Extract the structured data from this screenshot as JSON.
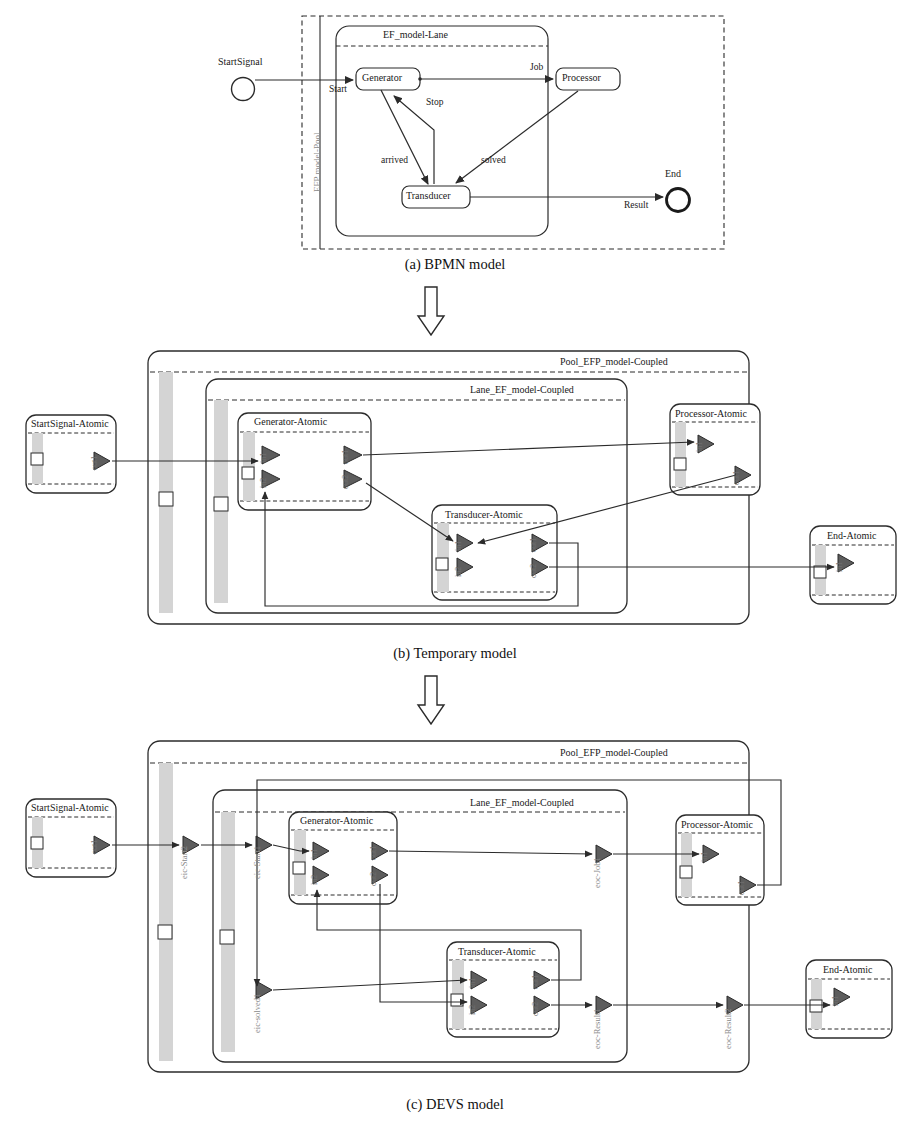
{
  "figure": {
    "panels": [
      {
        "id": "a",
        "caption": "(a) BPMN model"
      },
      {
        "id": "b",
        "caption": "(b) Temporary model"
      },
      {
        "id": "c",
        "caption": "(c) DEVS model"
      }
    ],
    "transform_arrow": "down-block-arrow"
  },
  "colors": {
    "stroke": "#2b2b2b",
    "port_fill": "#5d5d5d",
    "band_fill": "#d4d4d4",
    "label_grey": "#8a8a8a",
    "background": "#ffffff"
  },
  "panel_a": {
    "pool_label": "EFP model-Pool",
    "lane_label": "EF_model-Lane",
    "start_event_label": "StartSignal",
    "end_event_label": "End",
    "tasks": [
      {
        "name": "Generator"
      },
      {
        "name": "Processor"
      },
      {
        "name": "Transducer"
      }
    ],
    "flows": [
      {
        "label": "Start",
        "from": "StartSignal",
        "to": "Generator"
      },
      {
        "label": "Job",
        "from": "Generator",
        "to": "Processor"
      },
      {
        "label": "Stop",
        "from": "Transducer",
        "to": "Generator"
      },
      {
        "label": "arrived",
        "from": "Generator",
        "to": "Transducer"
      },
      {
        "label": "solved",
        "from": "Processor",
        "to": "Transducer"
      },
      {
        "label": "Result",
        "from": "Transducer",
        "to": "End"
      }
    ]
  },
  "panel_b": {
    "pool_label": "Pool_EFP_model-Coupled",
    "lane_label": "Lane_EF_model-Coupled",
    "atomics": [
      {
        "title": "StartSignal-Atomic",
        "ports": [
          "out1"
        ]
      },
      {
        "title": "Generator-Atomic",
        "ports": [
          "in1",
          "in2",
          "out1",
          "out2"
        ]
      },
      {
        "title": "Processor-Atomic",
        "ports": [
          "in1",
          "out1"
        ]
      },
      {
        "title": "Transducer-Atomic",
        "ports": [
          "in1",
          "in2",
          "out1",
          "out2"
        ]
      },
      {
        "title": "End-Atomic",
        "ports": [
          "in1"
        ]
      }
    ],
    "port_labels": {
      "startsignal_out1": "out1",
      "generator_in1": "in1",
      "generator_in2": "in2",
      "generator_out1": "out1",
      "generator_out2": "out2",
      "processor_in1": "in1",
      "processor_out1": "out1",
      "transducer_in1": "in1",
      "transducer_in2": "in2",
      "transducer_out1": "out1",
      "transducer_out2": "out2",
      "end_in1": "in1"
    }
  },
  "panel_c": {
    "pool_label": "Pool_EFP_model-Coupled",
    "lane_label": "Lane_EF_model-Coupled",
    "atomics": [
      {
        "title": "StartSignal-Atomic",
        "ports": [
          "out1"
        ]
      },
      {
        "title": "Generator-Atomic",
        "ports": [
          "in1",
          "in2",
          "out1",
          "out2"
        ]
      },
      {
        "title": "Processor-Atomic",
        "ports": [
          "in1",
          "out1"
        ]
      },
      {
        "title": "Transducer-Atomic",
        "ports": [
          "in1",
          "in2",
          "out1",
          "out2"
        ]
      },
      {
        "title": "End-Atomic",
        "ports": [
          "in1"
        ]
      }
    ],
    "coupling_ports": [
      {
        "name": "eic-Start2",
        "kind": "eic",
        "container": "pool"
      },
      {
        "name": "eic-Start1",
        "kind": "eic",
        "container": "lane"
      },
      {
        "name": "eic-solved1",
        "kind": "eic",
        "container": "lane"
      },
      {
        "name": "eoc-Job1",
        "kind": "eoc",
        "container": "lane"
      },
      {
        "name": "eoc-Result1",
        "kind": "eoc",
        "container": "lane"
      },
      {
        "name": "eoc-Result2",
        "kind": "eoc",
        "container": "pool"
      }
    ],
    "port_labels": {
      "startsignal_out1": "out1",
      "generator_in1": "in1",
      "generator_in2": "in2",
      "generator_out1": "out1",
      "generator_out2": "out2",
      "processor_in1": "in1",
      "processor_out1": "out1",
      "transducer_in1": "in1",
      "transducer_in2": "in2",
      "transducer_out1": "out1",
      "transducer_out2": "out2",
      "end_in1": "in1"
    }
  }
}
